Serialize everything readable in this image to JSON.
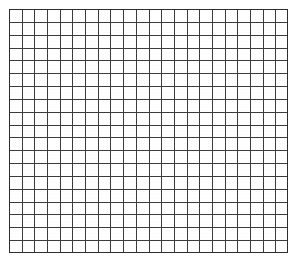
{
  "page": {
    "title": "Blank graph paper grid",
    "background_color": "#ffffff",
    "width": 301,
    "height": 266
  },
  "grid": {
    "label": "graph-paper-grid",
    "columns": 22,
    "rows": 19,
    "cell_width": 12.68,
    "cell_height": 12.84,
    "origin_x": 9,
    "origin_y": 9,
    "width": 279,
    "height": 244,
    "line_color": "#3c3c3c",
    "line_width": 1,
    "border_color": "#2e2e2e",
    "border_width": 1,
    "cell_fill": "#ffffff",
    "has_labels": false,
    "has_axis_ticks": false,
    "has_text": false
  },
  "chart_data": {
    "type": "table",
    "title": "",
    "subtitle": "",
    "xlabel": "",
    "ylabel": "",
    "grid": true,
    "legend": null,
    "categories": [],
    "values": [],
    "series": [],
    "annotations": [],
    "note": "Empty grid / graph paper: 22 columns by 19 rows of uniform square cells, no plotted data, no tick labels, no legend."
  }
}
